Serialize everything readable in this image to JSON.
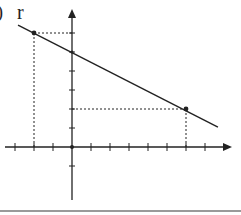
{
  "figure": {
    "line_label": "r",
    "partial_label": ")",
    "colors": {
      "ink": "#222222",
      "divider": "#9a9a9a"
    }
  },
  "axes": {
    "origin_px": [
      72,
      147
    ],
    "unit_px": 19,
    "x_ticks": [
      -3,
      -2,
      -1,
      1,
      2,
      3,
      4,
      5,
      6,
      7
    ],
    "y_ticks": [
      -1,
      1,
      2,
      3,
      4,
      5,
      6
    ],
    "x_arrow": "right",
    "y_arrow": "up"
  },
  "line": {
    "from": [
      -2.84,
      6.42
    ],
    "to": [
      7.68,
      1.05
    ]
  },
  "points": [
    {
      "name": "upper-point",
      "x": -2,
      "y": 6
    },
    {
      "name": "lower-point",
      "x": 6,
      "y": 2
    }
  ],
  "y_intercept": 5
}
